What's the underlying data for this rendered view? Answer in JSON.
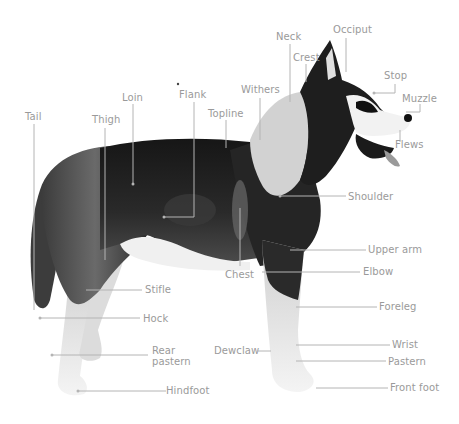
{
  "diagram": {
    "colors": {
      "label": "#9a9a9a",
      "leader": "#b4b4b4",
      "dark_coat": "#1c1c1c",
      "mid_coat": "#6e6e6e",
      "light_coat": "#e6e6e6",
      "background": "#ffffff"
    },
    "labels": {
      "neck": "Neck",
      "occiput": "Occiput",
      "crest": "Crest",
      "stop": "Stop",
      "muzzle": "Muzzle",
      "flews": "Flews",
      "withers": "Withers",
      "topline": "Topline",
      "flank": "Flank",
      "loin": "Loin",
      "thigh": "Thigh",
      "tail": "Tail",
      "shoulder": "Shoulder",
      "upper_arm": "Upper arm",
      "chest": "Chest",
      "elbow": "Elbow",
      "stifle": "Stifle",
      "foreleg": "Foreleg",
      "hock": "Hock",
      "wrist": "Wrist",
      "rear_pastern": "Rear\npastern",
      "dewclaw": "Dewclaw",
      "pastern": "Pastern",
      "hindfoot": "Hindfoot",
      "front_foot": "Front foot"
    }
  }
}
